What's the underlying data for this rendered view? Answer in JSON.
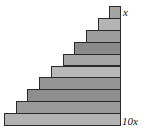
{
  "diagram": {
    "labels": {
      "top": "x",
      "bottom": "10x"
    },
    "bars": [
      {
        "length_units": 1,
        "color": "#a4a4a4"
      },
      {
        "length_units": 2,
        "color": "#b4b4b4"
      },
      {
        "length_units": 3,
        "color": "#9c9c9c"
      },
      {
        "length_units": 4,
        "color": "#8a8a8a"
      },
      {
        "length_units": 5,
        "color": "#a6a6a6"
      },
      {
        "length_units": 6,
        "color": "#b8b8b8"
      },
      {
        "length_units": 7,
        "color": "#959595"
      },
      {
        "length_units": 8,
        "color": "#8e8e8e"
      },
      {
        "length_units": 9,
        "color": "#9a9a9a"
      },
      {
        "length_units": 10,
        "color": "#b2b2b2"
      }
    ]
  }
}
